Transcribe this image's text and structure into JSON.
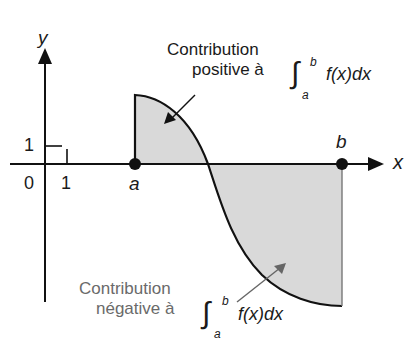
{
  "diagram": {
    "title": "",
    "axes": {
      "x_label": "x",
      "y_label": "y",
      "origin_label": "0",
      "x_tick_label": "1",
      "y_tick_label": "1"
    },
    "points": {
      "a_label": "a",
      "b_label": "b"
    },
    "annotations": {
      "positive": {
        "line1": "Contribution",
        "line2": "positive à",
        "integral_sign": "∫",
        "lower": "a",
        "upper": "b",
        "integrand": "f(x)dx"
      },
      "negative": {
        "line1": "Contribution",
        "line2": "négative à",
        "integral_sign": "∫",
        "lower": "a",
        "upper": "b",
        "integrand": "f(x)dx"
      }
    },
    "colors": {
      "fill": "#d9d9d9",
      "stroke": "#111111",
      "negative_text": "#6a6a6a"
    }
  }
}
